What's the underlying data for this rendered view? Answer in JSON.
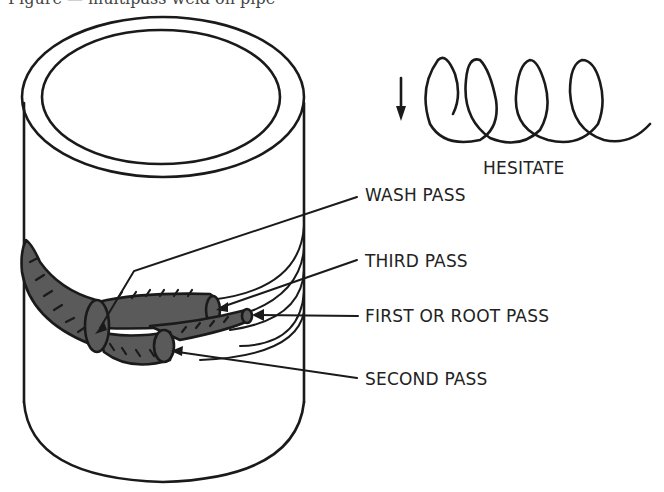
{
  "figure": {
    "caption_cut": "Figure — multipass weld on pipe",
    "labels": {
      "hesitate": "HESITATE",
      "wash_pass": "WASH PASS",
      "third_pass": "THIRD PASS",
      "root_pass": "FIRST OR ROOT PASS",
      "second_pass": "SECOND PASS"
    },
    "colors": {
      "line": "#1a1a1a",
      "bead": "#5a5a5a",
      "background": "#ffffff"
    }
  }
}
